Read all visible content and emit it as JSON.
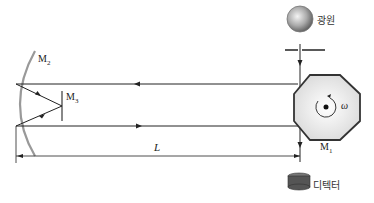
{
  "diagram": {
    "title": "",
    "labels": {
      "light_source": "광원",
      "detector": "디텍터",
      "mirror_rotating": "M",
      "mirror_rotating_sub": "1",
      "mirror_curved": "M",
      "mirror_curved_sub": "2",
      "mirror_flat": "M",
      "mirror_flat_sub": "3",
      "distance": "L",
      "angular_velocity": "ω"
    },
    "colors": {
      "line": "#222222",
      "mirror_curved": "#999999",
      "octagon_fill": "#e8e8e8",
      "detector": "#555555"
    }
  }
}
